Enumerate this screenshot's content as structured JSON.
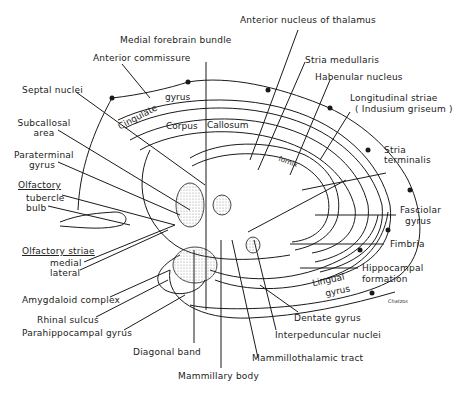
{
  "figure": {
    "signature": "Chatzos"
  },
  "labels": {
    "medial_forebrain_bundle": "Medial forebrain bundle",
    "anterior_commissure": "Anterior commissure",
    "anterior_nucleus_thalamus": "Anterior nucleus of thalamus",
    "stria_medullaris": "Stria medullaris",
    "habenular_nucleus": "Habenular nucleus",
    "longitudinal_striae": "Longitudinal striae",
    "indusium_griseum": "( Indusium griseum )",
    "septal_nuclei": "Septal nuclei",
    "subcallosal": "Subcallosal",
    "subcallosal_area": "area",
    "paraterminal": "Paraterminal",
    "paraterminal_gyrus": "gyrus",
    "olfactory": "Olfactory",
    "tubercle": "tubercle",
    "bulb": "bulb",
    "olfactory_striae": "Olfactory striae",
    "medial": "medial",
    "lateral": "lateral",
    "amygdaloid_complex": "Amygdaloid complex",
    "rhinal_sulcus": "Rhinal sulcus",
    "parahippocampal_gyrus": "Parahippocampal gyrus",
    "diagonal_band": "Diagonal band",
    "mammillary_body": "Mammillary body",
    "mammillothalamic_tract": "Mammillothalamic tract",
    "interpeduncular_nuclei": "Interpeduncular nuclei",
    "dentate_gyrus": "Dentate gyrus",
    "hippocampal": "Hippocampal",
    "formation": "formation",
    "fimbria": "Fimbria",
    "fasciolar": "Fasciolar",
    "fasciolar_gyrus": "gyrus",
    "stria": "Stria",
    "terminalis": "terminalis"
  },
  "structures": {
    "cingulate": "Cingulate",
    "gyrus": "gyrus",
    "corpus": "Corpus",
    "callosum": "Callosum",
    "fornix": "fornix",
    "lingual": "Lingual",
    "lingual_gyrus": "gyrus"
  },
  "colors": {
    "ink": "#1a1a1a",
    "background": "#ffffff",
    "stipple": "#888888"
  }
}
